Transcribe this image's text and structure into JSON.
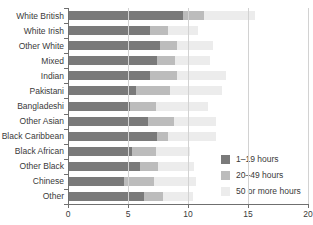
{
  "chart_data": {
    "type": "bar",
    "orientation": "horizontal",
    "stacked": true,
    "title": "",
    "xlabel": "",
    "ylabel": "",
    "xlim": [
      0,
      20
    ],
    "xticks": [
      0,
      5,
      10,
      15,
      20
    ],
    "grid": true,
    "legend_position": "bottom-right",
    "categories": [
      "White British",
      "White Irish",
      "Other White",
      "Mixed",
      "Indian",
      "Pakistani",
      "Bangladeshi",
      "Other Asian",
      "Black Caribbean",
      "Black African",
      "Other Black",
      "Chinese",
      "Other"
    ],
    "series": [
      {
        "name": "1–19 hours",
        "color": "#7a7a7a",
        "values": [
          9.6,
          6.8,
          7.7,
          7.4,
          6.8,
          5.7,
          5.2,
          6.7,
          7.4,
          5.3,
          6.0,
          4.7,
          6.3
        ]
      },
      {
        "name": "20–49 hours",
        "color": "#bcbcbc",
        "values": [
          1.7,
          1.5,
          1.4,
          1.5,
          2.3,
          2.8,
          2.1,
          2.1,
          0.9,
          2.0,
          1.5,
          2.5,
          1.6
        ]
      },
      {
        "name": "50 or more hours",
        "color": "#ececec",
        "values": [
          4.3,
          2.5,
          3.0,
          2.9,
          4.1,
          4.3,
          4.4,
          3.5,
          4.0,
          2.9,
          3.0,
          3.5,
          2.5
        ]
      }
    ],
    "totals": [
      15.6,
      10.8,
      12.1,
      11.8,
      13.2,
      12.8,
      11.7,
      12.3,
      12.3,
      10.2,
      10.5,
      10.7,
      10.4
    ]
  },
  "legend": {
    "items": [
      {
        "label": "1–19 hours",
        "color": "#7a7a7a"
      },
      {
        "label": "20–49 hours",
        "color": "#bcbcbc"
      },
      {
        "label": "50 or more hours",
        "color": "#ececec"
      }
    ]
  },
  "axis": {
    "x_tick_labels": [
      "0",
      "5",
      "10",
      "15",
      "20"
    ]
  }
}
